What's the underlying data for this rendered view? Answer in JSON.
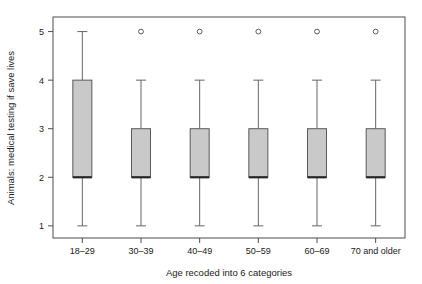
{
  "chart_data": {
    "type": "box",
    "title": "",
    "xlabel": "Age recoded into 6 categories",
    "ylabel": "Animals: medical testing if save lives",
    "categories": [
      "18–29",
      "30–39",
      "40–49",
      "50–59",
      "60–69",
      "70 and older"
    ],
    "ylim": [
      0.75,
      5.3
    ],
    "yticks": [
      1,
      2,
      3,
      4,
      5
    ],
    "ytick_labels": [
      "1",
      "2",
      "3",
      "4",
      "5"
    ],
    "grid": false,
    "legend": "none",
    "boxes": [
      {
        "category": "18–29",
        "whisker_low": 1,
        "q1": 2,
        "median": 2,
        "q3": 4,
        "whisker_high": 5,
        "outliers": []
      },
      {
        "category": "30–39",
        "whisker_low": 1,
        "q1": 2,
        "median": 2,
        "q3": 3,
        "whisker_high": 4,
        "outliers": [
          5
        ]
      },
      {
        "category": "40–49",
        "whisker_low": 1,
        "q1": 2,
        "median": 2,
        "q3": 3,
        "whisker_high": 4,
        "outliers": [
          5
        ]
      },
      {
        "category": "50–59",
        "whisker_low": 1,
        "q1": 2,
        "median": 2,
        "q3": 3,
        "whisker_high": 4,
        "outliers": [
          5
        ]
      },
      {
        "category": "60–69",
        "whisker_low": 1,
        "q1": 2,
        "median": 2,
        "q3": 3,
        "whisker_high": 4,
        "outliers": [
          5
        ]
      },
      {
        "category": "70 and older",
        "whisker_low": 1,
        "q1": 2,
        "median": 2,
        "q3": 3,
        "whisker_high": 4,
        "outliers": [
          5
        ]
      }
    ],
    "colors": {
      "box_fill": "#c9c9c9",
      "box_stroke": "#595959",
      "median": "#262626",
      "whisker": "#666666",
      "frame": "#4d4d4d",
      "text": "#1a1a1a"
    }
  }
}
